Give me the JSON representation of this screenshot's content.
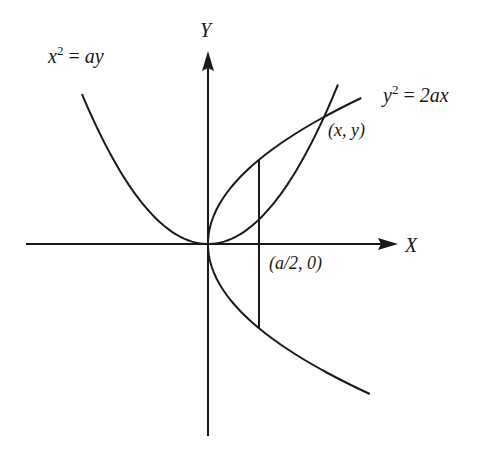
{
  "figure": {
    "axes": {
      "x_label": "X",
      "y_label": "Y"
    },
    "curves": [
      {
        "id": "parabola_up",
        "equation_lhs_base": "x",
        "equation_lhs_exp": "2",
        "equation_eq": "=",
        "equation_rhs": "ay"
      },
      {
        "id": "parabola_right",
        "equation_lhs_base": "y",
        "equation_lhs_exp": "2",
        "equation_eq": "=",
        "equation_rhs": "2ax"
      }
    ],
    "points": {
      "intersection": "(x, y)",
      "focus_a2": "(a/2, 0)"
    },
    "colors": {
      "ink": "#1a1a1a",
      "background": "#ffffff"
    }
  }
}
